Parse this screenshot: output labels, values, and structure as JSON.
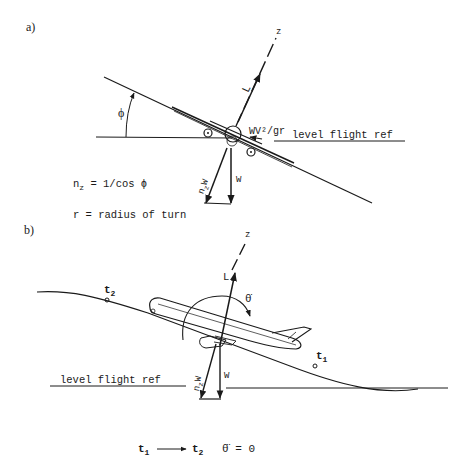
{
  "panel_a": {
    "label": "a)",
    "axis_label": "z",
    "lift_label": "L",
    "bank_angle_label": "ϕ",
    "centrifugal_label": "WV²/gr",
    "level_ref_label": "level flight ref",
    "load_vector_label": "n",
    "load_vector_sub": "z",
    "load_vector_suffix": "W",
    "weight_label": "W",
    "equation_1_main": "n",
    "equation_1_sub": "z",
    "equation_1_rest": " = 1/cos ϕ",
    "equation_2": "r = radius of turn"
  },
  "panel_b": {
    "label": "b)",
    "axis_label": "z",
    "lift_label": "L",
    "pitch_rate_label": "θ̇",
    "t2_label": "t",
    "t2_sub": "2",
    "t1_label": "t",
    "t1_sub": "1",
    "level_ref_label": "level flight ref",
    "load_vector_label": "n",
    "load_vector_sub": "z",
    "load_vector_suffix": "W",
    "weight_label": "W"
  },
  "footer": {
    "from_main": "t",
    "from_sub": "1",
    "to_main": "t",
    "to_sub": "2",
    "condition": "θ̈ = 0"
  }
}
